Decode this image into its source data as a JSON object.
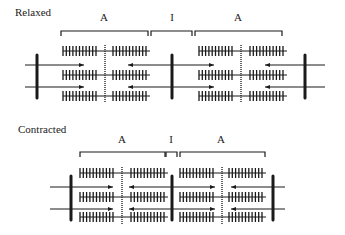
{
  "figure": {
    "panels": [
      {
        "id": "relaxed",
        "title": "Relaxed",
        "segments": [
          {
            "label": "A",
            "x1": 61,
            "x2": 148
          },
          {
            "label": "I",
            "x1": 151,
            "x2": 192
          },
          {
            "label": "A",
            "x1": 195,
            "x2": 282
          }
        ],
        "label_y": 12,
        "bracket_y": 31,
        "z_lines": [
          37,
          172,
          305
        ],
        "m_lines": [
          105,
          241
        ],
        "z_top": 55,
        "z_bottom": 98,
        "thick_rows": [
          51,
          75,
          96
        ],
        "thick_blocks": [
          [
            63,
            97
          ],
          [
            113,
            148
          ],
          [
            199,
            233
          ],
          [
            250,
            285
          ]
        ],
        "thin_rows": [
          65,
          87
        ],
        "thin_filaments": [
          {
            "x1": 25,
            "x2": 84,
            "dir": "right"
          },
          {
            "x1": 128,
            "x2": 214,
            "dir": "both"
          },
          {
            "x1": 265,
            "x2": 325,
            "dir": "left"
          }
        ]
      },
      {
        "id": "contracted",
        "title": "Contracted",
        "segments": [
          {
            "label": "A",
            "x1": 80,
            "x2": 165
          },
          {
            "label": "I",
            "x1": 166,
            "x2": 177
          },
          {
            "label": "A",
            "x1": 180,
            "x2": 265
          }
        ],
        "label_y": 134,
        "bracket_y": 152,
        "z_lines": [
          71,
          172,
          273
        ],
        "m_lines": [
          122,
          222
        ],
        "z_top": 176,
        "z_bottom": 220,
        "thick_rows": [
          173,
          197,
          217
        ],
        "thick_blocks": [
          [
            80,
            113
          ],
          [
            131,
            166
          ],
          [
            180,
            214
          ],
          [
            229,
            264
          ]
        ],
        "thin_rows": [
          187,
          209
        ],
        "thin_filaments": [
          {
            "x1": 50,
            "x2": 113,
            "dir": "right"
          },
          {
            "x1": 129,
            "x2": 215,
            "dir": "both"
          },
          {
            "x1": 231,
            "x2": 285,
            "dir": "left"
          }
        ]
      }
    ],
    "colors": {
      "ink": "#1a1a1a",
      "mline": "#666666"
    }
  }
}
